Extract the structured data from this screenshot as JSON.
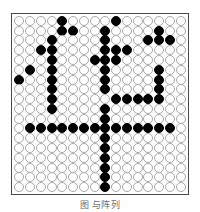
{
  "figure": {
    "caption": "图                     与阵列",
    "colors": {
      "filled_bead": "#000000",
      "empty_bead_fill": "#ffffff",
      "empty_bead_stroke": "#a8a8a8",
      "plate_border": "#4a4a4a",
      "background": "#ffffff"
    }
  },
  "grid_data": {
    "type": "binary-matrix",
    "rows": 18,
    "cols": 16,
    "filled_value": 1,
    "empty_value": 0,
    "legend": {
      "0": "empty-bead",
      "1": "filled-bead"
    },
    "matrix": [
      [
        0,
        0,
        0,
        0,
        1,
        0,
        0,
        0,
        0,
        1,
        0,
        0,
        0,
        0,
        0,
        0
      ],
      [
        0,
        0,
        0,
        0,
        1,
        1,
        0,
        0,
        1,
        0,
        0,
        0,
        0,
        1,
        0,
        0
      ],
      [
        0,
        0,
        0,
        1,
        0,
        0,
        0,
        0,
        1,
        0,
        0,
        0,
        1,
        1,
        1,
        0
      ],
      [
        0,
        0,
        1,
        1,
        0,
        0,
        0,
        0,
        1,
        1,
        1,
        0,
        0,
        0,
        0,
        0
      ],
      [
        0,
        0,
        0,
        1,
        0,
        0,
        0,
        1,
        1,
        1,
        0,
        0,
        0,
        0,
        0,
        0
      ],
      [
        0,
        1,
        0,
        1,
        0,
        0,
        0,
        0,
        1,
        0,
        0,
        0,
        0,
        1,
        0,
        0
      ],
      [
        1,
        0,
        0,
        1,
        0,
        0,
        0,
        0,
        1,
        0,
        0,
        0,
        0,
        1,
        0,
        0
      ],
      [
        0,
        0,
        0,
        1,
        0,
        0,
        0,
        0,
        1,
        0,
        0,
        0,
        0,
        1,
        0,
        0
      ],
      [
        0,
        0,
        0,
        1,
        0,
        0,
        0,
        0,
        0,
        1,
        1,
        1,
        1,
        1,
        0,
        0
      ],
      [
        0,
        0,
        0,
        1,
        0,
        0,
        0,
        0,
        1,
        0,
        0,
        0,
        0,
        0,
        0,
        0
      ],
      [
        0,
        0,
        0,
        0,
        0,
        0,
        0,
        0,
        1,
        0,
        0,
        0,
        0,
        0,
        0,
        0
      ],
      [
        0,
        1,
        1,
        1,
        1,
        1,
        1,
        1,
        1,
        1,
        1,
        1,
        1,
        1,
        1,
        0
      ],
      [
        0,
        0,
        0,
        0,
        0,
        0,
        0,
        0,
        1,
        0,
        0,
        0,
        0,
        0,
        0,
        0
      ],
      [
        0,
        0,
        0,
        0,
        0,
        0,
        0,
        0,
        1,
        0,
        0,
        0,
        0,
        0,
        0,
        0
      ],
      [
        0,
        0,
        0,
        0,
        0,
        0,
        0,
        0,
        1,
        0,
        0,
        0,
        0,
        0,
        0,
        0
      ],
      [
        0,
        0,
        0,
        0,
        0,
        0,
        0,
        0,
        1,
        0,
        0,
        0,
        0,
        0,
        0,
        0
      ],
      [
        0,
        0,
        0,
        0,
        0,
        0,
        0,
        0,
        1,
        0,
        0,
        0,
        0,
        0,
        0,
        0
      ],
      [
        0,
        0,
        0,
        0,
        0,
        0,
        0,
        0,
        1,
        0,
        0,
        0,
        0,
        0,
        0,
        0
      ]
    ]
  }
}
